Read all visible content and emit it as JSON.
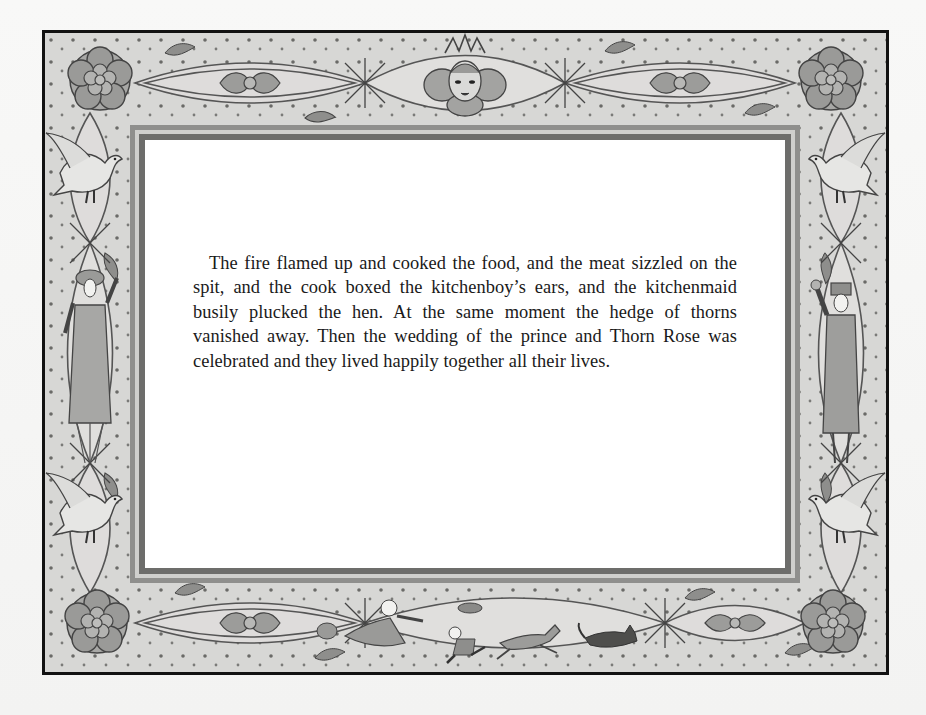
{
  "page": {
    "story_text": "The fire flamed up and cooked the food, and the meat sizzled on the spit, and the cook boxed the kitchenboy’s ears, and the kitchenmaid busily plucked the hen. At the same moment the hedge of thorns vanished away. Then the wedding of the prince and Thorn Rose was celebrated and they lived happily together all their lives."
  },
  "illustration": {
    "style": "grayscale ornamental border",
    "corners": [
      "rose-flower",
      "rose-flower",
      "rose-flower",
      "rose-flower"
    ],
    "top_center": "sun-face-with-crown",
    "left_side": [
      "dove",
      "lady-in-dotted-gown",
      "dove"
    ],
    "right_side": [
      "dove",
      "trumpeter-man",
      "dove"
    ],
    "bottom_center": [
      "hen",
      "cook-running",
      "kitchenboy-with-dish",
      "deer",
      "black-cat"
    ],
    "colors": {
      "border_black": "#111111",
      "ornament_bg": "#d7d7d5",
      "ornament_ink": "#4a4a48",
      "ornament_fill": "#a9a9a7",
      "panel": "#ffffff",
      "text": "#1a1a1a"
    }
  }
}
